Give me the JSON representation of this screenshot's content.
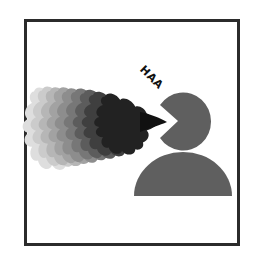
{
  "pictogram": {
    "title": "Person exhaling / sneezing",
    "exclamation": "HAA",
    "colors": {
      "frame": "#2b2b2b",
      "figure": "#5f5f5f",
      "text": "#111111",
      "background": "#ffffff",
      "plume_gradient": [
        "#dcdcdc",
        "#c6c6c6",
        "#b0b0b0",
        "#9a9a9a",
        "#848484",
        "#6e6e6e",
        "#555555",
        "#3c3c3c",
        "#1e1e1e"
      ]
    },
    "elements": [
      "head",
      "body",
      "exhale-plume",
      "exclamation-text",
      "frame"
    ]
  }
}
